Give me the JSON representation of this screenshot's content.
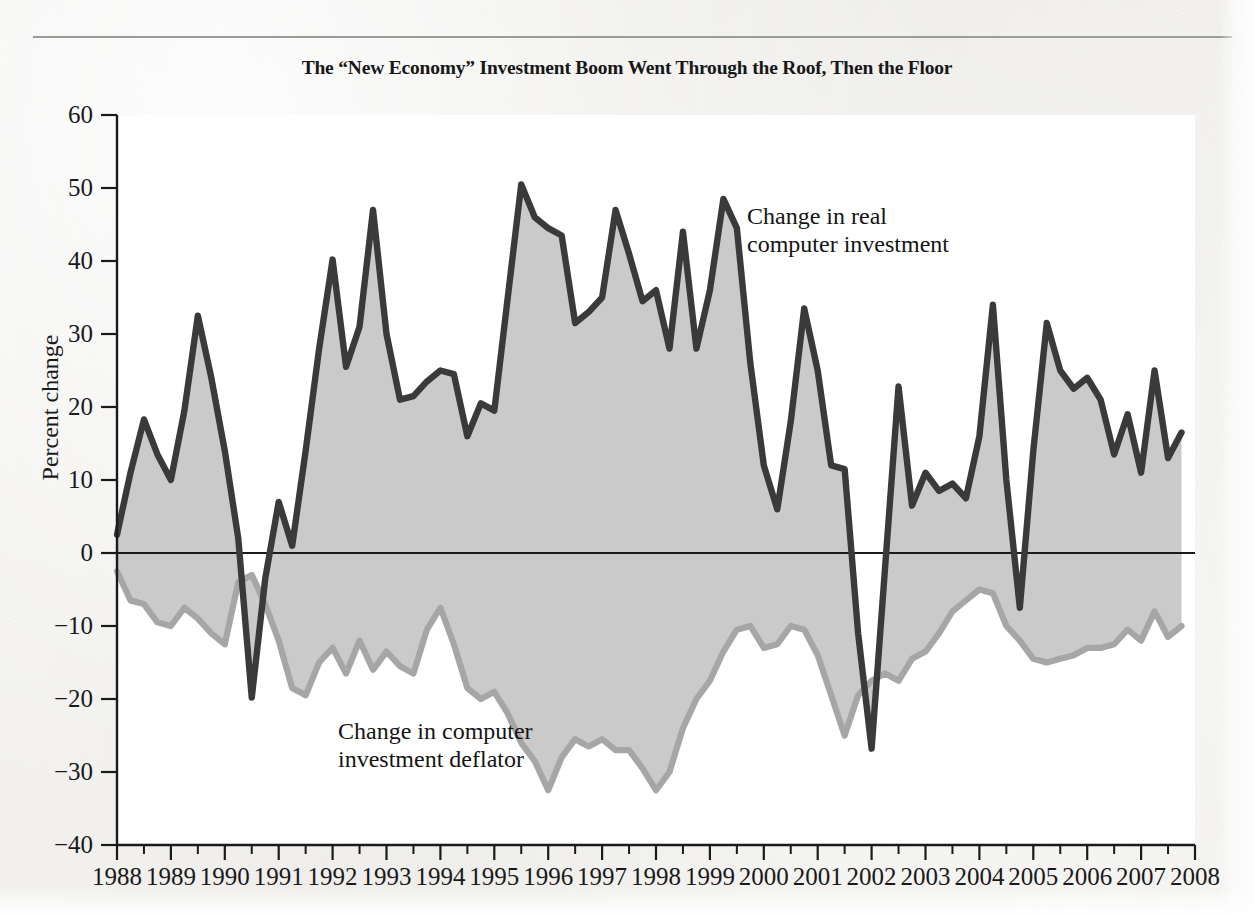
{
  "chart_title": "The “New Economy” Investment Boom Went Through the Roof, Then the Floor",
  "annotations": {
    "investment_line1": "Change in real",
    "investment_line2": "computer investment",
    "deflator_line1": "Change in computer",
    "deflator_line2": "investment deflator"
  },
  "axes": {
    "y_title": "Percent change",
    "y_ticks": [
      "60",
      "50",
      "40",
      "30",
      "20",
      "10",
      "0",
      "−10",
      "−20",
      "−30",
      "−40"
    ],
    "x_ticks": [
      "1988",
      "1989",
      "1990",
      "1991",
      "1992",
      "1993",
      "1994",
      "1995",
      "1996",
      "1997",
      "1998",
      "1999",
      "2000",
      "2001",
      "2002",
      "2003",
      "2004",
      "2005",
      "2006",
      "2007",
      "2008"
    ]
  },
  "colors": {
    "investment_line": "#3a3a3a",
    "deflator_line": "#a6a6a6",
    "fill": "#c6c6c6",
    "axis": "#1a1a1a",
    "paper": "#f2f1ef"
  },
  "bottom_caption": "",
  "chart_data": {
    "type": "line",
    "title": "The “New Economy” Investment Boom Went Through the Roof, Then the Floor",
    "xlabel": "",
    "ylabel": "Percent change",
    "ylim": [
      -40,
      60
    ],
    "xlim": [
      1988,
      2008
    ],
    "grid": false,
    "legend": "annotations-inline",
    "x_tick_step": 1,
    "y_tick_step": 10,
    "x_minor_ticks_per_year": 2,
    "fill_between": true,
    "x": [
      1988.0,
      1988.25,
      1988.5,
      1988.75,
      1989.0,
      1989.25,
      1989.5,
      1989.75,
      1990.0,
      1990.25,
      1990.5,
      1990.75,
      1991.0,
      1991.25,
      1991.5,
      1991.75,
      1992.0,
      1992.25,
      1992.5,
      1992.75,
      1993.0,
      1993.25,
      1993.5,
      1993.75,
      1994.0,
      1994.25,
      1994.5,
      1994.75,
      1995.0,
      1995.25,
      1995.5,
      1995.75,
      1996.0,
      1996.25,
      1996.5,
      1996.75,
      1997.0,
      1997.25,
      1997.5,
      1997.75,
      1998.0,
      1998.25,
      1998.5,
      1998.75,
      1999.0,
      1999.25,
      1999.5,
      1999.75,
      2000.0,
      2000.25,
      2000.5,
      2000.75,
      2001.0,
      2001.25,
      2001.5,
      2001.75,
      2002.0,
      2002.25,
      2002.5,
      2002.75,
      2003.0,
      2003.25,
      2003.5,
      2003.75,
      2004.0,
      2004.25,
      2004.5,
      2004.75,
      2005.0,
      2005.25,
      2005.5,
      2005.75,
      2006.0,
      2006.25,
      2006.5,
      2006.75,
      2007.0,
      2007.25,
      2007.5,
      2007.75
    ],
    "series": [
      {
        "name": "Change in real computer investment",
        "color": "#3a3a3a",
        "values": [
          2.5,
          11.0,
          18.3,
          13.5,
          10.0,
          19.5,
          32.5,
          24.0,
          14.0,
          2.0,
          -19.8,
          -3.5,
          7.0,
          1.0,
          14.0,
          28.0,
          40.2,
          25.5,
          31.0,
          47.0,
          30.0,
          21.0,
          21.5,
          23.5,
          25.0,
          24.5,
          16.0,
          20.5,
          19.5,
          35.0,
          50.5,
          46.0,
          44.5,
          43.5,
          31.5,
          33.0,
          35.0,
          47.0,
          41.0,
          34.5,
          36.0,
          28.0,
          44.0,
          28.0,
          36.0,
          48.5,
          44.5,
          26.0,
          12.0,
          6.0,
          18.0,
          33.5,
          25.0,
          12.0,
          11.5,
          -11.0,
          -26.8,
          -2.0,
          22.8,
          6.5,
          11.0,
          8.5,
          9.5,
          7.5,
          16.0,
          34.0,
          10.0,
          -7.5,
          14.0,
          31.5,
          25.0,
          22.5,
          24.0,
          21.0,
          13.5,
          19.0,
          11.0,
          25.0,
          13.0,
          16.5
        ]
      },
      {
        "name": "Change in computer investment deflator",
        "color": "#a6a6a6",
        "values": [
          -2.5,
          -6.5,
          -7.0,
          -9.5,
          -10.0,
          -7.5,
          -9.0,
          -11.0,
          -12.5,
          -4.0,
          -3.0,
          -7.0,
          -12.0,
          -18.5,
          -19.5,
          -15.0,
          -13.0,
          -16.5,
          -12.0,
          -16.0,
          -13.5,
          -15.5,
          -16.5,
          -10.5,
          -7.5,
          -12.5,
          -18.5,
          -20.0,
          -19.0,
          -22.0,
          -26.0,
          -28.5,
          -32.5,
          -28.0,
          -25.5,
          -26.5,
          -25.5,
          -27.0,
          -27.0,
          -29.5,
          -32.5,
          -30.0,
          -24.0,
          -20.0,
          -17.5,
          -13.5,
          -10.5,
          -10.0,
          -13.0,
          -12.5,
          -10.0,
          -10.5,
          -14.0,
          -19.5,
          -25.0,
          -19.5,
          -17.5,
          -16.5,
          -17.5,
          -14.5,
          -13.5,
          -11.0,
          -8.0,
          -6.5,
          -5.0,
          -5.5,
          -10.0,
          -12.0,
          -14.5,
          -15.0,
          -14.5,
          -14.0,
          -13.0,
          -13.0,
          -12.5,
          -10.5,
          -12.0,
          -8.0,
          -11.5,
          -10.0
        ]
      }
    ]
  }
}
